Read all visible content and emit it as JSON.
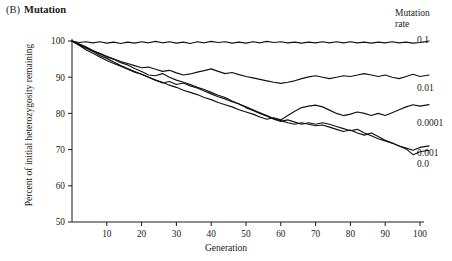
{
  "panel": {
    "label": "(B)",
    "title": "Mutation"
  },
  "axes": {
    "xlabel": "Generation",
    "ylabel": "Percent of initial heterozygosity remaining",
    "xticks": [
      10,
      20,
      30,
      40,
      50,
      60,
      70,
      80,
      90,
      100
    ],
    "yticks": [
      50,
      60,
      70,
      80,
      90,
      100
    ],
    "xlim": [
      0,
      100
    ],
    "ylim": [
      50,
      100
    ]
  },
  "legend": {
    "title_line1": "Mutation",
    "title_line2": "rate",
    "entries": [
      "0.1",
      "0.01",
      "0.0001",
      "0.001",
      "0.0"
    ]
  },
  "chart_data": {
    "type": "line",
    "xlabel": "Generation",
    "ylabel": "Percent of initial heterozygosity remaining",
    "xlim": [
      0,
      100
    ],
    "ylim": [
      50,
      100
    ],
    "grid": false,
    "legend_title": "Mutation rate",
    "legend_position": "right",
    "x": [
      0,
      2,
      4,
      6,
      8,
      10,
      12,
      14,
      16,
      18,
      20,
      22,
      24,
      26,
      28,
      30,
      32,
      34,
      36,
      38,
      40,
      42,
      44,
      46,
      48,
      50,
      52,
      54,
      56,
      58,
      60,
      62,
      64,
      66,
      68,
      70,
      72,
      74,
      76,
      78,
      80,
      82,
      84,
      86,
      88,
      90,
      92,
      94,
      96,
      98,
      100
    ],
    "series": [
      {
        "name": "0.1",
        "label": "0.1",
        "values": [
          100,
          99.6,
          99.8,
          99.5,
          99.8,
          99.4,
          99.7,
          99.3,
          99.7,
          99.4,
          99.8,
          99.5,
          99.9,
          99.5,
          99.8,
          99.4,
          99.7,
          99.3,
          99.8,
          99.5,
          99.9,
          99.6,
          99.8,
          99.4,
          99.7,
          99.4,
          99.8,
          99.5,
          99.9,
          99.6,
          99.8,
          99.5,
          99.7,
          99.4,
          99.7,
          99.5,
          99.8,
          99.5,
          99.8,
          99.5,
          99.8,
          99.5,
          99.7,
          99.4,
          99.7,
          99.5,
          99.8,
          99.5,
          99.7,
          99.4,
          99.6
        ]
      },
      {
        "name": "0.01",
        "label": "0.01",
        "values": [
          100,
          99.0,
          98.0,
          97.2,
          96.4,
          95.6,
          95.0,
          94.3,
          93.8,
          93.2,
          92.6,
          92.8,
          92.2,
          91.6,
          91.9,
          91.2,
          90.6,
          90.9,
          91.4,
          91.8,
          92.3,
          91.6,
          91.0,
          91.3,
          90.7,
          90.2,
          89.8,
          89.4,
          89.0,
          88.6,
          88.3,
          88.6,
          89.0,
          89.6,
          90.1,
          90.4,
          90.0,
          89.6,
          90.0,
          90.4,
          90.2,
          90.6,
          91.0,
          90.6,
          90.2,
          90.6,
          90.0,
          89.6,
          90.2,
          90.8,
          90.2
        ]
      },
      {
        "name": "0.0001",
        "label": "0.0001",
        "values": [
          100,
          98.8,
          97.6,
          96.6,
          95.6,
          94.6,
          93.8,
          93.0,
          92.2,
          91.4,
          90.8,
          90.0,
          89.2,
          88.6,
          87.8,
          87.2,
          86.4,
          85.8,
          85.2,
          84.4,
          83.8,
          83.0,
          82.4,
          81.8,
          81.0,
          80.4,
          79.8,
          79.0,
          78.4,
          78.8,
          78.2,
          79.4,
          80.6,
          81.6,
          82.0,
          82.3,
          81.8,
          80.9,
          80.0,
          79.4,
          79.8,
          80.4,
          80.0,
          79.4,
          80.0,
          79.4,
          80.2,
          81.0,
          81.8,
          82.4,
          82.0
        ]
      },
      {
        "name": "0.001",
        "label": "0.001",
        "values": [
          100,
          99.2,
          98.4,
          97.4,
          96.6,
          95.8,
          95.0,
          94.0,
          93.4,
          92.4,
          91.6,
          90.6,
          90.4,
          91.0,
          90.0,
          89.2,
          88.6,
          88.0,
          87.2,
          86.6,
          85.8,
          85.0,
          84.4,
          83.4,
          82.6,
          81.6,
          80.8,
          80.0,
          79.2,
          78.4,
          77.8,
          78.2,
          77.6,
          77.0,
          77.4,
          77.0,
          77.4,
          77.0,
          76.4,
          75.8,
          75.2,
          75.6,
          74.6,
          73.8,
          73.0,
          72.4,
          71.8,
          71.0,
          70.4,
          69.8,
          70.6
        ]
      },
      {
        "name": "0.0",
        "label": "0.0",
        "values": [
          100,
          99.0,
          98.2,
          97.2,
          96.0,
          95.2,
          94.2,
          93.2,
          92.4,
          91.6,
          90.8,
          90.0,
          89.2,
          88.4,
          88.8,
          88.0,
          88.4,
          87.6,
          87.0,
          86.2,
          85.4,
          84.6,
          84.0,
          83.2,
          82.6,
          81.8,
          81.0,
          80.2,
          79.4,
          78.6,
          78.0,
          77.4,
          77.0,
          77.4,
          77.0,
          76.6,
          76.8,
          76.2,
          75.6,
          75.0,
          75.4,
          74.6,
          74.0,
          74.6,
          73.6,
          72.6,
          71.8,
          71.0,
          70.2,
          68.6,
          69.4
        ]
      }
    ]
  }
}
